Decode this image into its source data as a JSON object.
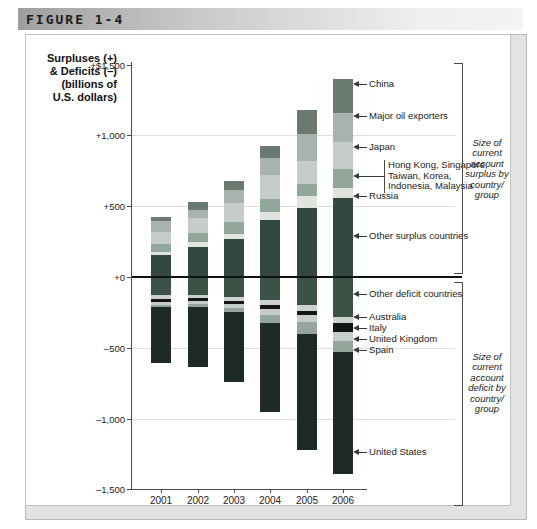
{
  "header": {
    "figure_label": "FIGURE 1-4"
  },
  "axis_title_lines": [
    "Surpluses (+)",
    "& Deficits (–)",
    "(billions of",
    "U.S. dollars)"
  ],
  "chart_data": {
    "type": "bar",
    "stacked": true,
    "categories": [
      "2001",
      "2002",
      "2003",
      "2004",
      "2005",
      "2006"
    ],
    "ylabel": "Surpluses (+) & Deficits (–) (billions of U.S. dollars)",
    "ylim": [
      -1500,
      1500
    ],
    "grid_values": [
      1000,
      500,
      -500,
      -1000
    ],
    "y_ticks": [
      {
        "label": "+$1,500",
        "value": 1500
      },
      {
        "label": "+1,000",
        "value": 1000
      },
      {
        "label": "+500",
        "value": 500
      },
      {
        "label": "+0",
        "value": 0
      },
      {
        "label": "–500",
        "value": -500
      },
      {
        "label": "–1,000",
        "value": -1000
      },
      {
        "label": "–1,500",
        "value": -1500
      }
    ],
    "series_surplus": [
      {
        "name": "Other surplus countries",
        "color": "#33493f",
        "values": [
          155,
          215,
          270,
          405,
          485,
          555
        ]
      },
      {
        "name": "Russia",
        "color": "#dfe4df",
        "values": [
          25,
          30,
          35,
          55,
          85,
          75
        ]
      },
      {
        "name": "Hong Kong, Singapore, Taiwan, Korea, Indonesia, Malaysia",
        "color": "#93a69c",
        "values": [
          50,
          65,
          85,
          90,
          85,
          135
        ]
      },
      {
        "name": "Japan",
        "color": "#c6cdc8",
        "values": [
          90,
          110,
          135,
          170,
          165,
          185
        ]
      },
      {
        "name": "Major oil exporters",
        "color": "#a9b3ad",
        "values": [
          75,
          55,
          90,
          120,
          190,
          210
        ]
      },
      {
        "name": "China",
        "color": "#6b7a70",
        "values": [
          30,
          55,
          60,
          85,
          170,
          240
        ]
      }
    ],
    "series_deficit": [
      {
        "name": "Other deficit countries",
        "color": "#3c5247",
        "values": [
          130,
          125,
          140,
          160,
          195,
          280
        ]
      },
      {
        "name": "Australia",
        "color": "#ccd2cc",
        "values": [
          25,
          20,
          30,
          40,
          42,
          45
        ]
      },
      {
        "name": "Italy",
        "color": "#151515",
        "values": [
          20,
          25,
          20,
          25,
          30,
          60
        ]
      },
      {
        "name": "United Kingdom",
        "color": "#c6cdc8",
        "values": [
          20,
          20,
          30,
          45,
          50,
          65
        ]
      },
      {
        "name": "Spain",
        "color": "#95a59b",
        "values": [
          20,
          25,
          30,
          55,
          85,
          80
        ]
      },
      {
        "name": "United States",
        "color": "#1e2b25",
        "values": [
          390,
          420,
          490,
          630,
          820,
          860
        ]
      }
    ],
    "annotations": [
      {
        "text": "China",
        "y": 84
      },
      {
        "text": "Major oil exporters",
        "y": 116
      },
      {
        "text": "Japan",
        "y": 147
      },
      {
        "lines": [
          "Hong Kong, Singapore,",
          "Taiwan, Korea,",
          "Indonesia, Malaysia"
        ],
        "y": 176
      },
      {
        "text": "Russia",
        "y": 196
      },
      {
        "text": "Other surplus countries",
        "y": 236
      },
      {
        "text": "Other deficit countries",
        "y": 294
      },
      {
        "text": "Australia",
        "y": 317
      },
      {
        "text": "Italy",
        "y": 328
      },
      {
        "text": "United Kingdom",
        "y": 339
      },
      {
        "text": "Spain",
        "y": 350
      },
      {
        "text": "United States",
        "y": 452
      }
    ],
    "bracket_captions": {
      "surplus": [
        "Size of",
        "current",
        "account",
        "surplus by",
        "country/",
        "group"
      ],
      "deficit": [
        "Size of",
        "current",
        "account",
        "deficit by",
        "country/",
        "group"
      ]
    },
    "layout": {
      "zeroY": 277,
      "pxPer500": 70.8,
      "axisX": 131,
      "axisTop": 62,
      "axisBottom": 489,
      "gridRight": 455,
      "zeroLineRight": 462,
      "axisBottomRight": 367,
      "barWidth": 20,
      "barCenters": [
        161,
        198,
        234,
        270,
        307,
        343
      ],
      "labelLineX1": 353,
      "labelLineX2": 367,
      "labelTextX": 369,
      "hkBracketX": 384,
      "bracketX": 462,
      "surplusBracket": [
        63,
        273
      ],
      "deficitBracket": [
        282,
        505
      ],
      "captionLeft": 451,
      "captionWidth": 72,
      "surplusCaptionTop": 138,
      "deficitCaptionTop": 352,
      "xLabelY": 495
    }
  }
}
